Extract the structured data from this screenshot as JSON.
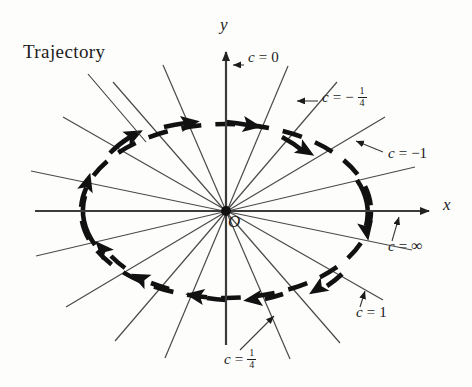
{
  "figure": {
    "background_color": "#fdfdfc",
    "ink_color": "#111111",
    "axis_color": "#3c3c3c",
    "ray_color": "#4a4a4a"
  },
  "axes": {
    "x_label": "x",
    "y_label": "y",
    "origin_label": "O",
    "origin": {
      "x": 226,
      "y": 211
    },
    "x_axis": {
      "x_start": 35,
      "x_end": 437,
      "y": 211
    },
    "y_axis": {
      "x": 226,
      "y_start": 345,
      "y_end": 44
    }
  },
  "trajectory": {
    "label": "Trajectory",
    "shape": "ellipse",
    "style": "dashed",
    "direction": "clockwise",
    "center": {
      "x": 226,
      "y": 211
    },
    "radius_x": 145,
    "radius_y": 87,
    "arrow_count": 12
  },
  "level_lines": [
    {
      "id": "c-zero",
      "label_var": "c",
      "label_eq": "=",
      "label_value": "0",
      "value_type": "integer",
      "label_x": 246,
      "label_y": 57,
      "pointer_from": {
        "x": 244,
        "y": 65
      },
      "pointer_to": {
        "x": 229,
        "y": 65
      }
    },
    {
      "id": "c-neg-quarter",
      "label_var": "c",
      "label_eq": "=",
      "label_value": "-1/4",
      "value_type": "negative-fraction",
      "numerator": "1",
      "denominator": "4",
      "label_x": 321,
      "label_y": 93,
      "pointer_from": {
        "x": 318,
        "y": 101
      },
      "pointer_to": {
        "x": 293,
        "y": 101
      }
    },
    {
      "id": "c-neg-one",
      "label_var": "c",
      "label_eq": "=",
      "label_value": "-1",
      "value_type": "negative-integer",
      "label_x": 386,
      "label_y": 154,
      "pointer_from": {
        "x": 383,
        "y": 152
      },
      "pointer_to": {
        "x": 353,
        "y": 140
      }
    },
    {
      "id": "c-infinity",
      "label_var": "c",
      "label_eq": "=",
      "label_value": "∞",
      "value_type": "infinity",
      "label_x": 388,
      "label_y": 245,
      "pointer_from": {
        "x": 392,
        "y": 240
      },
      "pointer_to": {
        "x": 400,
        "y": 214
      }
    },
    {
      "id": "c-one",
      "label_var": "c",
      "label_eq": "=",
      "label_value": "1",
      "value_type": "integer",
      "label_x": 357,
      "label_y": 312,
      "pointer_from": {
        "x": 360,
        "y": 306
      },
      "pointer_to": {
        "x": 366,
        "y": 288
      }
    },
    {
      "id": "c-quarter",
      "label_var": "c",
      "label_eq": "=",
      "label_value": "1/4",
      "value_type": "fraction",
      "numerator": "1",
      "denominator": "4",
      "label_x": 226,
      "label_y": 354,
      "pointer_from": {
        "x": 238,
        "y": 350
      },
      "pointer_to": {
        "x": 277,
        "y": 312
      }
    }
  ],
  "trajectory_callout": {
    "label": "Trajectory",
    "label_x": 23,
    "label_y": 47,
    "leader_from": {
      "x": 88,
      "y": 74
    },
    "leader_to": {
      "x": 146,
      "y": 142
    }
  }
}
